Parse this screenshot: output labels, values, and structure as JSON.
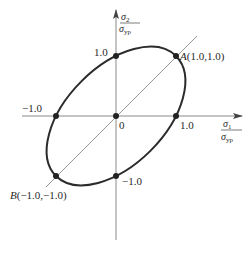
{
  "figure": {
    "type": "yield-locus-ellipse",
    "colors": {
      "ellipse": "#2b2b2b",
      "axes": "#8a8a8a",
      "points": "#222222",
      "text": "#2a2a2a"
    },
    "axes": {
      "x_label": {
        "num": "σ",
        "num_sub": "1",
        "den": "σ",
        "den_sub": "yp"
      },
      "y_label": {
        "num": "σ",
        "num_sub": "2",
        "den": "σ",
        "den_sub": "yp"
      }
    },
    "tick_labels": {
      "x_pos": "1.0",
      "x_neg": "−1.0",
      "y_pos": "1.0",
      "y_neg": "−1.0",
      "origin": "0"
    },
    "points": [
      {
        "name": "A",
        "label": "A(1.0,1.0)",
        "x": 1.0,
        "y": 1.0
      },
      {
        "name": "B",
        "label": "B(−1.0,−1.0)",
        "x": -1.0,
        "y": -1.0
      },
      {
        "x": 1.0,
        "y": 0.0
      },
      {
        "x": -1.0,
        "y": 0.0
      },
      {
        "x": 0.0,
        "y": 1.0
      },
      {
        "x": 0.0,
        "y": -1.0
      },
      {
        "x": 0.0,
        "y": 0.0
      }
    ],
    "labels": {
      "A_letter": "A",
      "A_coords": "(1.0,1.0)",
      "B_letter": "B",
      "B_coords": "(−1.0,−1.0)"
    }
  }
}
